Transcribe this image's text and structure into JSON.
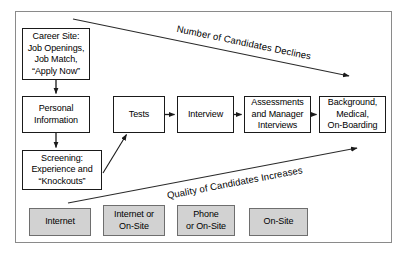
{
  "diagram": {
    "frame": {
      "label": "diagram-frame"
    },
    "colors": {
      "node_fill": "#ffffff",
      "node_stroke": "#1a1a1a",
      "channel_fill": "#d2d2d2",
      "channel_stroke": "#6e6e6e",
      "frame_stroke": "#8a8a8a",
      "arrow": "#1a1a1a",
      "text": "#000000"
    },
    "process_nodes": [
      {
        "id": "career-site",
        "label": "Career Site:\nJob Openings,\nJob Match,\n“Apply Now”"
      },
      {
        "id": "personal-information",
        "label": "Personal\nInformation"
      },
      {
        "id": "screening",
        "label": "Screening:\nExperience and\n“Knockouts”"
      },
      {
        "id": "tests",
        "label": "Tests"
      },
      {
        "id": "interview",
        "label": "Interview"
      },
      {
        "id": "assessments-manager-interviews",
        "label": "Assessments\nand Manager\nInterviews"
      },
      {
        "id": "background-medical-onboarding",
        "label": "Background,\nMedical,\nOn-Boarding"
      }
    ],
    "channel_nodes": [
      {
        "id": "internet",
        "label": "Internet"
      },
      {
        "id": "internet-or-on-site",
        "label": "Internet or\nOn-Site"
      },
      {
        "id": "phone-or-on-site",
        "label": "Phone\nor On-Site"
      },
      {
        "id": "on-site",
        "label": "On-Site"
      }
    ],
    "annotations": [
      {
        "id": "candidates-declines",
        "label": "Number of Candidates Declines"
      },
      {
        "id": "quality-increases",
        "label": "Quality of Candidates Increases"
      }
    ]
  }
}
